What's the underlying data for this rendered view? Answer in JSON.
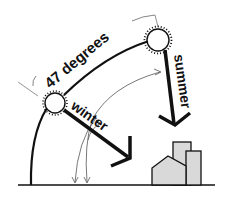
{
  "diagram": {
    "labels": {
      "angle": "47 degrees",
      "winter": "winter",
      "summer": "summer"
    },
    "colors": {
      "ink": "#111111",
      "thin_line": "#555555",
      "building_fill": "#d9d9d9",
      "background": "#ffffff"
    },
    "elements": {
      "sun_winter": "sun-icon",
      "sun_summer": "sun-icon",
      "buildings": "building-group",
      "ground": "ground-line"
    }
  }
}
